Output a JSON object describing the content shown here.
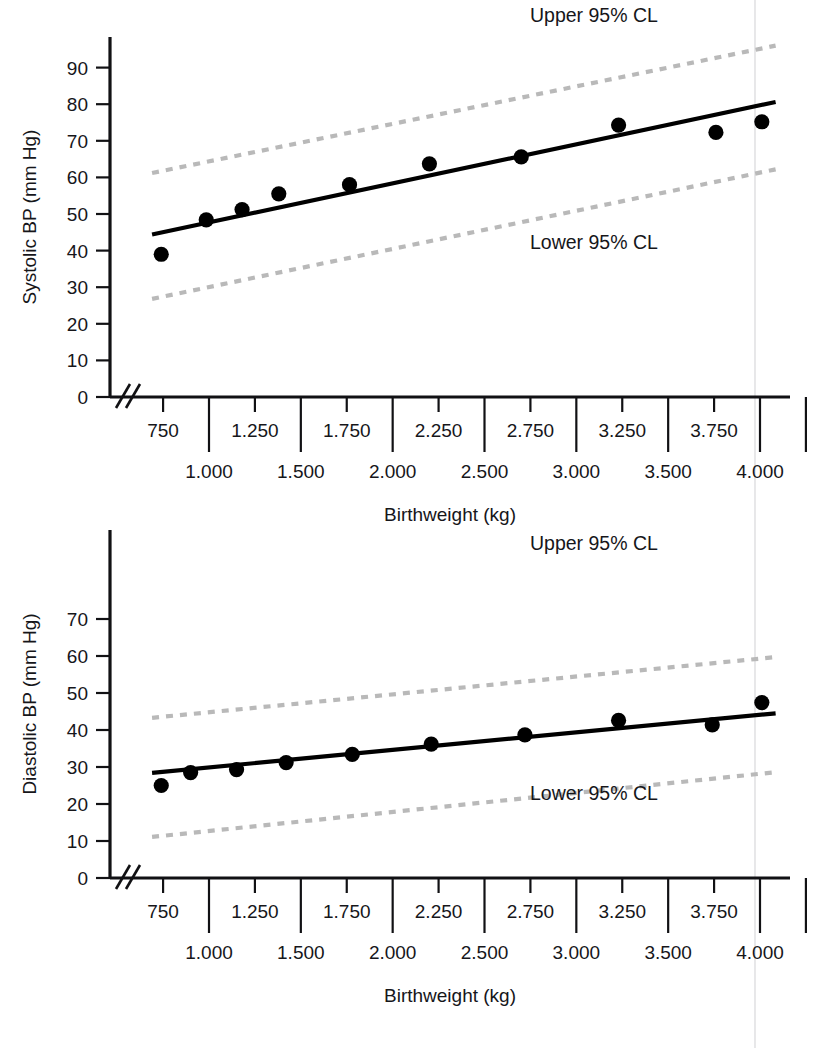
{
  "figure": {
    "width": 825,
    "height": 1048,
    "background": "#ffffff",
    "accent_dark": "#000000",
    "cl_color": "#b9b9b9",
    "page_rule_color": "#e2e2e4"
  },
  "chart_data": [
    {
      "type": "scatter",
      "id": "systolic",
      "title": "",
      "xlabel": "Birthweight (kg)",
      "ylabel": "Systolic BP (mm Hg)",
      "xlim": [
        500,
        4250
      ],
      "ylim": [
        0,
        97
      ],
      "grid": false,
      "axis_break_x": true,
      "ytick_values": [
        0,
        10,
        20,
        30,
        40,
        50,
        60,
        70,
        80,
        90
      ],
      "ytick_labels": [
        "0",
        "10",
        "20",
        "30",
        "40",
        "50",
        "60",
        "70",
        "80",
        "90"
      ],
      "xtick_minor_values": [
        750,
        1250,
        1750,
        2250,
        2750,
        3250,
        3750
      ],
      "xtick_minor_labels": [
        "750",
        "1.250",
        "1.750",
        "2.250",
        "2.750",
        "3.250",
        "3.750"
      ],
      "xtick_major_values": [
        1000,
        1500,
        2000,
        2500,
        3000,
        3500,
        4000
      ],
      "xtick_major_labels": [
        "1.000",
        "1.500",
        "2.000",
        "2.500",
        "3.000",
        "3.500",
        "4.000"
      ],
      "x": [
        750,
        1000,
        1250,
        1500,
        1750,
        2000,
        2250,
        2500,
        2750,
        3000,
        3250,
        3500,
        3750,
        4000
      ],
      "y": [
        39.0,
        48.4,
        51.2,
        55.5,
        58.0,
        63.7,
        65.6,
        74.3,
        72.3,
        75.2
      ],
      "points": [
        {
          "x": 740,
          "y": 39.0
        },
        {
          "x": 985,
          "y": 48.4
        },
        {
          "x": 1180,
          "y": 51.2
        },
        {
          "x": 1380,
          "y": 55.5
        },
        {
          "x": 1765,
          "y": 58.0
        },
        {
          "x": 2200,
          "y": 63.7
        },
        {
          "x": 2700,
          "y": 65.6
        },
        {
          "x": 3230,
          "y": 74.3
        },
        {
          "x": 3760,
          "y": 72.3
        },
        {
          "x": 4010,
          "y": 75.2
        }
      ],
      "series": [
        {
          "name": "Regression line",
          "style": "solid",
          "color": "#000000",
          "endpoints": [
            {
              "x": 690,
              "y": 44.4
            },
            {
              "x": 4085,
              "y": 80.6
            }
          ]
        },
        {
          "name": "Upper 95% CL",
          "style": "dotted",
          "color": "#b9b9b9",
          "label": "Upper 95% CL",
          "endpoints": [
            {
              "x": 690,
              "y": 61.2
            },
            {
              "x": 4085,
              "y": 96.0
            }
          ]
        },
        {
          "name": "Lower 95% CL",
          "style": "dotted",
          "color": "#b9b9b9",
          "label": "Lower 95% CL",
          "endpoints": [
            {
              "x": 690,
              "y": 26.8
            },
            {
              "x": 4085,
              "y": 62.2
            }
          ]
        }
      ],
      "annotations": [
        {
          "text": "Upper 95% CL",
          "x": 2850,
          "y": 105.0
        },
        {
          "text": "Lower 95% CL",
          "x": 2850,
          "y": 44.6
        }
      ]
    },
    {
      "type": "scatter",
      "id": "diastolic",
      "title": "",
      "xlabel": "Birthweight (kg)",
      "ylabel": "Diastolic BP (mm Hg)",
      "xlim": [
        500,
        4250
      ],
      "ylim": [
        0,
        73
      ],
      "grid": false,
      "axis_break_x": true,
      "ytick_values": [
        0,
        10,
        20,
        30,
        40,
        50,
        60,
        70
      ],
      "ytick_labels": [
        "0",
        "10",
        "20",
        "30",
        "40",
        "50",
        "60",
        "70"
      ],
      "xtick_minor_values": [
        750,
        1250,
        1750,
        2250,
        2750,
        3250,
        3750
      ],
      "xtick_minor_labels": [
        "750",
        "1.250",
        "1.750",
        "2.250",
        "2.750",
        "3.250",
        "3.750"
      ],
      "xtick_major_values": [
        1000,
        1500,
        2000,
        2500,
        3000,
        3500,
        4000
      ],
      "xtick_major_labels": [
        "1.000",
        "1.500",
        "2.000",
        "2.500",
        "3.000",
        "3.500",
        "4.000"
      ],
      "x": [
        740,
        900,
        1150,
        1420,
        1780,
        2210,
        2720,
        3230,
        3740,
        4010
      ],
      "y": [
        25.0,
        28.5,
        29.3,
        31.2,
        33.4,
        36.2,
        38.7,
        42.6,
        41.4,
        47.4
      ],
      "points": [
        {
          "x": 740,
          "y": 25.0
        },
        {
          "x": 900,
          "y": 28.5
        },
        {
          "x": 1150,
          "y": 29.3
        },
        {
          "x": 1420,
          "y": 31.2
        },
        {
          "x": 1780,
          "y": 33.4
        },
        {
          "x": 2210,
          "y": 36.2
        },
        {
          "x": 2720,
          "y": 38.7
        },
        {
          "x": 3230,
          "y": 42.6
        },
        {
          "x": 3740,
          "y": 41.4
        },
        {
          "x": 4010,
          "y": 47.4
        }
      ],
      "series": [
        {
          "name": "Regression line",
          "style": "solid",
          "color": "#000000",
          "endpoints": [
            {
              "x": 690,
              "y": 28.4
            },
            {
              "x": 4085,
              "y": 44.5
            }
          ]
        },
        {
          "name": "Upper 95% CL",
          "style": "dotted",
          "color": "#b9b9b9",
          "label": "Upper 95% CL",
          "endpoints": [
            {
              "x": 690,
              "y": 43.3
            },
            {
              "x": 4085,
              "y": 59.7
            }
          ]
        },
        {
          "name": "Lower 95% CL",
          "style": "dotted",
          "color": "#b9b9b9",
          "label": "Lower 95% CL",
          "endpoints": [
            {
              "x": 690,
              "y": 11.1
            },
            {
              "x": 4085,
              "y": 28.6
            }
          ]
        }
      ],
      "annotations": [
        {
          "text": "Upper 95% CL",
          "x": 2850,
          "y": 64.2
        },
        {
          "text": "Lower 95% CL",
          "x": 2850,
          "y": 18.0
        }
      ]
    }
  ],
  "charts": {
    "top": {
      "y_axis_title": "Systolic BP (mm Hg)",
      "x_axis_title": "Birthweight (kg)",
      "upper_cl_label": "Upper 95% CL",
      "lower_cl_label": "Lower 95% CL",
      "y_ticks": [
        "90",
        "80",
        "70",
        "60",
        "50",
        "40",
        "30",
        "20",
        "10",
        "0"
      ],
      "x_ticks_upper": [
        "750",
        "1.250",
        "1.750",
        "2.250",
        "2.750",
        "3.250",
        "3.750"
      ],
      "x_ticks_lower": [
        "1.000",
        "1.500",
        "2.000",
        "2.500",
        "3.000",
        "3.500",
        "4.000"
      ]
    },
    "bottom": {
      "y_axis_title": "Diastolic BP (mm Hg)",
      "x_axis_title": "Birthweight (kg)",
      "upper_cl_label": "Upper 95% CL",
      "lower_cl_label": "Lower 95% CL",
      "y_ticks": [
        "70",
        "60",
        "50",
        "40",
        "30",
        "20",
        "10",
        "0"
      ],
      "x_ticks_upper": [
        "750",
        "1.250",
        "1.750",
        "2.250",
        "2.750",
        "3.250",
        "3.750"
      ],
      "x_ticks_lower": [
        "1.000",
        "1.500",
        "2.000",
        "2.500",
        "3.000",
        "3.500",
        "4.000"
      ]
    }
  }
}
